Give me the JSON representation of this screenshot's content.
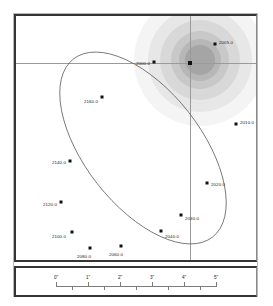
{
  "figure": {
    "type": "orbit-plot",
    "title": "",
    "primary_star": {
      "label": "",
      "x_arcsec": 4.0,
      "y_arcsec": 0.0
    },
    "gridlines": {
      "horizontal": true,
      "vertical": true,
      "color": "#9a9a9a"
    },
    "center_glow_color": "#b6b6b6"
  },
  "chart_data": {
    "type": "scatter",
    "title": "",
    "xlabel": "",
    "ylabel": "",
    "xlim": [
      -0.6,
      5.6
    ],
    "ylim": [
      -3.2,
      3.0
    ],
    "grid": true,
    "legend": null,
    "annotations": [
      "Relative orbit of companion about primary star",
      "Epoch markers labelled in years"
    ],
    "series": [
      {
        "name": "Companion epochs",
        "point_labels": [
          "2005.0",
          "2010.0",
          "2020.0",
          "2030.0",
          "2040.0",
          "2060.0",
          "2080.0",
          "2100.0",
          "2120.0",
          "2140.0",
          "2160.0",
          "2000.0"
        ],
        "x": [
          3.95,
          4.62,
          3.55,
          2.7,
          2.05,
          1.12,
          0.55,
          0.02,
          -0.32,
          -0.05,
          0.72,
          2.33
        ],
        "y": [
          2.1,
          1.05,
          -1.05,
          -1.65,
          -2.05,
          -2.5,
          -2.45,
          -1.95,
          -1.1,
          0.1,
          1.15,
          1.85
        ]
      },
      {
        "name": "Primary star",
        "point_labels": [
          ""
        ],
        "x": [
          4.0
        ],
        "y": [
          0.0
        ]
      }
    ]
  },
  "epochs": [
    {
      "label": "2005.0",
      "px": 199,
      "py": 28,
      "lx": 203,
      "ly": 24,
      "anchor": "left"
    },
    {
      "label": "2010.0",
      "px": 220,
      "py": 108,
      "lx": 224,
      "ly": 104,
      "anchor": "left"
    },
    {
      "label": "2020.0",
      "px": 191,
      "py": 167,
      "lx": 195,
      "ly": 166,
      "anchor": "left"
    },
    {
      "label": "2030.0",
      "px": 165,
      "py": 199,
      "lx": 169,
      "ly": 200,
      "anchor": "left"
    },
    {
      "label": "2040.0",
      "px": 145,
      "py": 215,
      "lx": 149,
      "ly": 218,
      "anchor": "left"
    },
    {
      "label": "2060.0",
      "px": 105,
      "py": 230,
      "lx": 100,
      "ly": 236,
      "anchor": "center"
    },
    {
      "label": "2080.0",
      "px": 74,
      "py": 232,
      "lx": 68,
      "ly": 238,
      "anchor": "center"
    },
    {
      "label": "2100.0",
      "px": 56,
      "py": 216,
      "lx": 50,
      "ly": 218,
      "anchor": "right"
    },
    {
      "label": "2120.0",
      "px": 45,
      "py": 186,
      "lx": 41,
      "ly": 186,
      "anchor": "right"
    },
    {
      "label": "2140.0",
      "px": 54,
      "py": 145,
      "lx": 50,
      "ly": 144,
      "anchor": "right"
    },
    {
      "label": "2160.0",
      "px": 86,
      "py": 81,
      "lx": 82,
      "ly": 83,
      "anchor": "right"
    },
    {
      "label": "2000.0",
      "px": 138,
      "py": 46,
      "lx": 134,
      "ly": 45,
      "anchor": "right"
    }
  ],
  "scale_bar": {
    "unit_suffix": "\"",
    "ticks": [
      {
        "label": "0\"",
        "px": 40,
        "major": true
      },
      {
        "label": "",
        "px": 56,
        "major": false
      },
      {
        "label": "1\"",
        "px": 72,
        "major": true
      },
      {
        "label": "",
        "px": 88,
        "major": false
      },
      {
        "label": "2\"",
        "px": 104,
        "major": true
      },
      {
        "label": "",
        "px": 120,
        "major": false
      },
      {
        "label": "3\"",
        "px": 136,
        "major": true
      },
      {
        "label": "",
        "px": 152,
        "major": false
      },
      {
        "label": "4\"",
        "px": 168,
        "major": true
      },
      {
        "label": "",
        "px": 184,
        "major": false
      },
      {
        "label": "5\"",
        "px": 200,
        "major": true
      }
    ]
  }
}
